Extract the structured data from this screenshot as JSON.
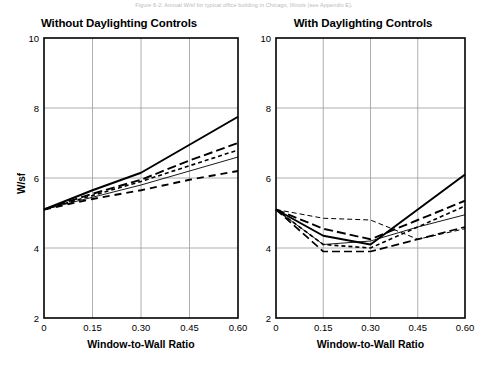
{
  "caption": "Figure 6-2: Annual W/sf for typical office building in Chicago, Illinois (see Appendix E).",
  "panels": [
    {
      "id": "without",
      "title": "Without Daylighting Controls",
      "ylabel": "W/sf",
      "xlabel": "Window-to-Wall Ratio",
      "show_ylabel": true
    },
    {
      "id": "with",
      "title": "With Daylighting Controls",
      "ylabel": "",
      "xlabel": "Window-to-Wall Ratio",
      "show_ylabel": false
    }
  ],
  "chart_data": [
    {
      "type": "line",
      "title": "Without Daylighting Controls",
      "xlabel": "Window-to-Wall Ratio",
      "ylabel": "W/sf",
      "x": [
        0,
        0.15,
        0.3,
        0.45,
        0.6
      ],
      "xlim": [
        0,
        0.6
      ],
      "ylim": [
        2,
        10
      ],
      "xticks": [
        0,
        0.15,
        0.3,
        0.45,
        0.6
      ],
      "xtick_labels": [
        "0",
        "0.15",
        "0.30",
        "0.45",
        "0.60"
      ],
      "yticks": [
        2,
        4,
        6,
        8,
        10
      ],
      "ytick_labels": [
        "2",
        "4",
        "6",
        "8",
        "10"
      ],
      "grid": true,
      "legend": "none",
      "series": [
        {
          "name": "series-1",
          "style": "solid-thick",
          "values": [
            5.1,
            5.65,
            6.15,
            6.95,
            7.75
          ]
        },
        {
          "name": "series-2",
          "style": "long-dash",
          "values": [
            5.1,
            5.55,
            5.95,
            6.5,
            7.0
          ]
        },
        {
          "name": "series-3",
          "style": "short-dash",
          "values": [
            5.1,
            5.5,
            5.9,
            6.35,
            6.8
          ]
        },
        {
          "name": "series-4",
          "style": "solid-thin",
          "values": [
            5.1,
            5.45,
            5.8,
            6.2,
            6.6
          ]
        },
        {
          "name": "series-5",
          "style": "dash-medium",
          "values": [
            5.1,
            5.4,
            5.65,
            5.95,
            6.2
          ]
        }
      ]
    },
    {
      "type": "line",
      "title": "With Daylighting Controls",
      "xlabel": "Window-to-Wall Ratio",
      "ylabel": "",
      "x": [
        0,
        0.15,
        0.3,
        0.45,
        0.6
      ],
      "xlim": [
        0,
        0.6
      ],
      "ylim": [
        2,
        10
      ],
      "xticks": [
        0,
        0.15,
        0.3,
        0.45,
        0.6
      ],
      "xtick_labels": [
        "0",
        "0.15",
        "0.30",
        "0.45",
        "0.60"
      ],
      "yticks": [
        2,
        4,
        6,
        8,
        10
      ],
      "ytick_labels": [
        "2",
        "4",
        "6",
        "8",
        "10"
      ],
      "grid": true,
      "legend": "none",
      "series": [
        {
          "name": "series-1",
          "style": "solid-thick",
          "values": [
            5.1,
            4.35,
            4.1,
            5.1,
            6.1
          ]
        },
        {
          "name": "series-2",
          "style": "long-dash",
          "values": [
            5.1,
            4.55,
            4.25,
            4.8,
            5.35
          ]
        },
        {
          "name": "series-3",
          "style": "short-dash",
          "values": [
            5.1,
            4.1,
            4.0,
            4.6,
            5.2
          ]
        },
        {
          "name": "series-4",
          "style": "solid-thin",
          "values": [
            5.1,
            4.1,
            4.2,
            4.6,
            4.95
          ]
        },
        {
          "name": "series-5",
          "style": "thin-dash-flat",
          "values": [
            5.1,
            4.85,
            4.8,
            4.25,
            4.55
          ]
        },
        {
          "name": "series-6",
          "style": "dash-low",
          "values": [
            5.1,
            3.9,
            3.9,
            4.25,
            4.6
          ]
        }
      ]
    }
  ],
  "colors": {
    "axis": "#000000",
    "grid": "#9a9a9a",
    "line": "#000000",
    "background": "#ffffff"
  }
}
